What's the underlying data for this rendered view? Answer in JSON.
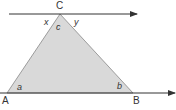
{
  "diagram": {
    "type": "geometry-triangle-parallel-lines",
    "colors": {
      "fill": "#d9d9d9",
      "stroke": "#666666",
      "line": "#333333",
      "text": "#333333"
    },
    "vertices": {
      "A": {
        "label": "A",
        "x": 7,
        "y": 93
      },
      "B": {
        "label": "B",
        "x": 133,
        "y": 93
      },
      "C": {
        "label": "C",
        "x": 60,
        "y": 14
      }
    },
    "angles": {
      "a": "a",
      "b": "b",
      "c": "c",
      "x": "x",
      "y": "y"
    },
    "lines": [
      {
        "name": "top-parallel-line",
        "through": "C",
        "arrow": "right"
      },
      {
        "name": "base-line",
        "through": "A-B",
        "arrow": "right"
      }
    ]
  }
}
